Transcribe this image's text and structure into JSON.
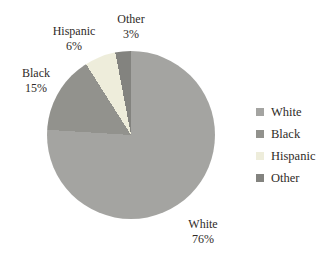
{
  "chart_data": {
    "type": "pie",
    "title": "",
    "categories": [
      "White",
      "Black",
      "Hispanic",
      "Other"
    ],
    "values": [
      76,
      15,
      6,
      3
    ],
    "unit": "%",
    "start_angle_deg": 0,
    "direction": "clockwise",
    "legend_position": "right",
    "grid": false,
    "colors": {
      "White": "#a4a4a1",
      "Black": "#92928d",
      "Hispanic": "#eeeddb",
      "Other": "#83837f"
    },
    "text_color": "#2f2b28",
    "background_color": "#ffffff",
    "slice_labels": [
      {
        "name": "White",
        "value_text": "76%"
      },
      {
        "name": "Black",
        "value_text": "15%"
      },
      {
        "name": "Hispanic",
        "value_text": "6%"
      },
      {
        "name": "Other",
        "value_text": "3%"
      }
    ],
    "legend_items": [
      "White",
      "Black",
      "Hispanic",
      "Other"
    ]
  }
}
